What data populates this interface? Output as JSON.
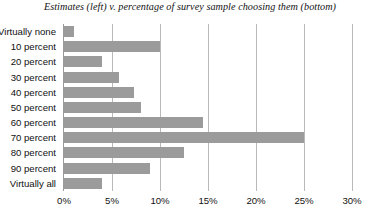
{
  "chart_data": {
    "type": "bar",
    "orientation": "horizontal",
    "title": "Estimates (left) v. percentage of survey sample choosing them (bottom)",
    "xlabel": "",
    "ylabel": "",
    "categories": [
      "Virtually none",
      "10 percent",
      "20 percent",
      "30 percent",
      "40 percent",
      "50 percent",
      "60 percent",
      "70 percent",
      "80 percent",
      "90 percent",
      "Virtually all"
    ],
    "values": [
      1,
      10,
      4,
      5.7,
      7.3,
      8,
      14.5,
      25,
      12.5,
      9,
      4
    ],
    "xlim": [
      0,
      30
    ],
    "xticks": [
      0,
      5,
      10,
      15,
      20,
      25,
      30
    ],
    "xtick_labels": [
      "0%",
      "5%",
      "10%",
      "15%",
      "20%",
      "25%",
      "30%"
    ],
    "grid": true,
    "legend": false,
    "bar_color": "#9b9b9b",
    "gridline_color": "#b9b9b9",
    "axis_color": "#9a9a9a",
    "background_color": "#ffffff"
  }
}
